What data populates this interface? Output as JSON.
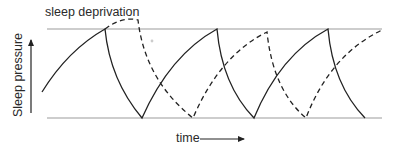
{
  "diagram": {
    "annotation": "sleep deprivation",
    "y_axis_label": "Sleep pressure",
    "x_axis_label": "time",
    "colors": {
      "reference_lines": "#bdbdbd",
      "curves": "#222222",
      "text": "#2a2a2a"
    },
    "legend_implicit": [
      {
        "style": "solid",
        "meaning": "normal sleep-wake cycle"
      },
      {
        "style": "dashed",
        "meaning": "cycle shifted by sleep deprivation"
      }
    ]
  }
}
